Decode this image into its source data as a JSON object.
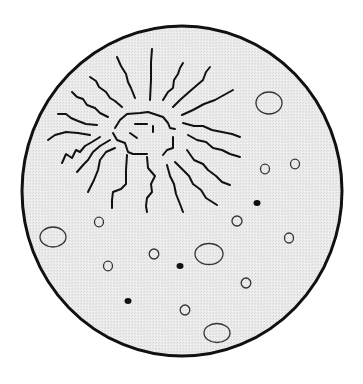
{
  "figure": {
    "title": "",
    "colors": {
      "background": "#ffffff",
      "field_fill": "#e9e9e9",
      "field_border": "#111111",
      "ink": "#111111",
      "bubble_stroke": "#333333"
    },
    "field": {
      "cx": 182,
      "cy": 191,
      "rx": 160,
      "ry": 165,
      "stroke_width": 3
    },
    "particle": {
      "outline": "M115,128 L120,120 L127,114 L140,113 L148,112 L157,115 L163,117 L168,123 L170,128 L175,129",
      "outline_right": "M173,137 L173,148 L167,150 L163,155",
      "outline_bottom": "M147,154 L133,154 L128,152 L125,143 L117,140 L113,133",
      "marks": [
        "M135,124 L147,124",
        "M153,126 L153,132",
        "M130,133 L137,138"
      ]
    },
    "cracks": [
      "M150,100 L151,80 L151,62 L152,49",
      "M135,98 L131,88 L128,82 L126,74 L121,66 L117,57",
      "M122,107 L115,101 L110,98 L106,92 L99,87 L96,81 L90,77",
      "M108,117 L100,113 L95,108 L87,105 L83,99 L77,97 L72,92",
      "M97,125 L86,124 L78,121 L71,118 L66,114 L58,114",
      "M90,135 L78,133 L66,132 L55,135 L48,140",
      "M100,137 L92,142 L85,146 L80,152 L76,150 L72,158 L66,154 L62,163",
      "M110,140 L100,146 L93,152 L88,160 L84,164 L77,172",
      "M115,148 L106,152 L100,160 L98,170 L94,180 L88,192",
      "M127,155 L126,170 L126,184 L121,189 L113,192 L112,200 L112,208",
      "M147,157 L148,168 L155,176 L151,184 L152,192 L147,198 L146,206 L147,212",
      "M167,165 L170,176 L174,184 L176,194 L180,204 L183,212",
      "M175,162 L183,170 L189,176 L193,184 L201,190 L206,198 L217,205",
      "M187,150 L194,160 L203,164 L208,170 L216,176 L222,182 L230,185",
      "M188,135 L197,140 L206,142 L213,148 L222,150 L230,154 L240,157",
      "M183,123 L194,126 L203,126 L212,130 L222,132 L232,134 L240,137",
      "M182,115 L193,110 L204,104 L215,100 L224,95 L233,90",
      "M173,107 L180,100 L189,92 L196,86 L203,80 L206,72 L210,67",
      "M163,100 L168,92 L173,88 L174,80 L178,74 L180,68 L183,63"
    ],
    "bubbles": [
      {
        "cx": 269,
        "cy": 103,
        "rx": 13,
        "ry": 11
      },
      {
        "cx": 265,
        "cy": 169,
        "rx": 4.5,
        "ry": 4.8
      },
      {
        "cx": 295,
        "cy": 164,
        "rx": 4.5,
        "ry": 4.8
      },
      {
        "cx": 237,
        "cy": 221,
        "rx": 5,
        "ry": 5
      },
      {
        "cx": 289,
        "cy": 238,
        "rx": 4.5,
        "ry": 5
      },
      {
        "cx": 99,
        "cy": 222,
        "rx": 4.5,
        "ry": 4.8
      },
      {
        "cx": 53,
        "cy": 237,
        "rx": 13,
        "ry": 10
      },
      {
        "cx": 154,
        "cy": 254,
        "rx": 4.8,
        "ry": 5
      },
      {
        "cx": 209,
        "cy": 254,
        "rx": 14,
        "ry": 10.5
      },
      {
        "cx": 108,
        "cy": 266,
        "rx": 4.5,
        "ry": 4.8
      },
      {
        "cx": 246,
        "cy": 283,
        "rx": 4.8,
        "ry": 5
      },
      {
        "cx": 185,
        "cy": 310,
        "rx": 4.8,
        "ry": 5
      },
      {
        "cx": 217,
        "cy": 333,
        "rx": 13,
        "ry": 9.5
      }
    ],
    "dots": [
      {
        "cx": 257,
        "cy": 203,
        "rx": 3.5,
        "ry": 3
      },
      {
        "cx": 180,
        "cy": 266,
        "rx": 3.5,
        "ry": 3
      },
      {
        "cx": 128,
        "cy": 301,
        "rx": 3.5,
        "ry": 3
      }
    ]
  }
}
